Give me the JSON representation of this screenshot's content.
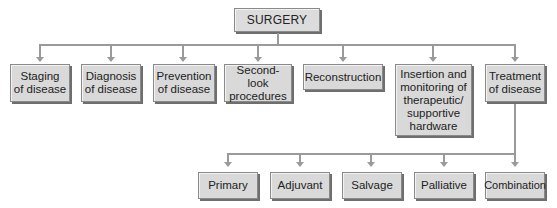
{
  "diagram": {
    "type": "hierarchy",
    "root": {
      "label": "SURGERY"
    },
    "level1": [
      {
        "id": "staging",
        "label": "Staging\nof disease"
      },
      {
        "id": "diagnosis",
        "label": "Diagnosis\nof disease"
      },
      {
        "id": "prevention",
        "label": "Prevention\nof disease"
      },
      {
        "id": "second-look",
        "label": "Second-look\nprocedures"
      },
      {
        "id": "reconstruction",
        "label": "Reconstruction"
      },
      {
        "id": "insertion",
        "label": "Insertion and\nmonitoring of\ntherapeutic/\nsupportive\nhardware"
      },
      {
        "id": "treatment",
        "label": "Treatment\nof disease"
      }
    ],
    "treatment_children": [
      {
        "id": "primary",
        "label": "Primary"
      },
      {
        "id": "adjuvant",
        "label": "Adjuvant"
      },
      {
        "id": "salvage",
        "label": "Salvage"
      },
      {
        "id": "palliative",
        "label": "Palliative"
      },
      {
        "id": "combination",
        "label": "Combination"
      }
    ],
    "colors": {
      "box_fill": "#d9d9d9",
      "box_border": "#8a8a8a",
      "shadow": "#6e6e6e",
      "connector": "#9a9a9a"
    }
  }
}
